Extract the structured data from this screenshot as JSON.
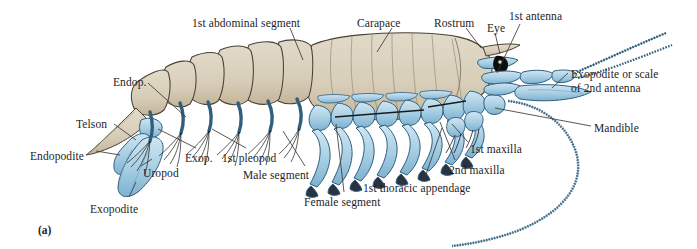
{
  "figure": {
    "caption": "(a)",
    "organism": "crayfish-lateral-anatomy",
    "background_color": "#ffffff"
  },
  "colors": {
    "carapace_tan": "#d9cfbb",
    "carapace_tan_shadow": "#c4b79d",
    "limb_blue": "#a8cfe4",
    "limb_blue_shadow": "#7fb4d2",
    "outline": "#2b2b2b",
    "seta_dark": "#1a1a1a",
    "label_text": "#1d1d1f",
    "leader_line": "#3a3a3a"
  },
  "labels": [
    {
      "id": "telson",
      "text": "Telson",
      "x": 76,
      "y": 118
    },
    {
      "id": "endop",
      "text": "Endop.",
      "x": 113,
      "y": 76
    },
    {
      "id": "endopodite",
      "text": "Endopodite",
      "x": 30,
      "y": 150
    },
    {
      "id": "uropod",
      "text": "Uropod",
      "x": 143,
      "y": 167
    },
    {
      "id": "exopodite",
      "text": "Exopodite",
      "x": 90,
      "y": 203
    },
    {
      "id": "exop",
      "text": "Exop.",
      "x": 185,
      "y": 152
    },
    {
      "id": "first-pleopod",
      "text": "1st pleopod",
      "x": 222,
      "y": 152
    },
    {
      "id": "male-segment",
      "text": "Male segment",
      "x": 243,
      "y": 169
    },
    {
      "id": "female-segment",
      "text": "Female segment",
      "x": 304,
      "y": 196
    },
    {
      "id": "first-abdominal",
      "text": "1st abdominal segment",
      "x": 192,
      "y": 17
    },
    {
      "id": "carapace",
      "text": "Carapace",
      "x": 357,
      "y": 17
    },
    {
      "id": "rostrum",
      "text": "Rostrum",
      "x": 434,
      "y": 17
    },
    {
      "id": "eye",
      "text": "Eye",
      "x": 487,
      "y": 22
    },
    {
      "id": "first-antenna",
      "text": "1st antenna",
      "x": 509,
      "y": 10
    },
    {
      "id": "exopodite-scale",
      "text": "Exopodite or scale\nof 2nd antenna",
      "x": 571,
      "y": 68
    },
    {
      "id": "mandible",
      "text": "Mandible",
      "x": 594,
      "y": 122
    },
    {
      "id": "first-maxilla",
      "text": "1st maxilla",
      "x": 470,
      "y": 143
    },
    {
      "id": "second-maxilla",
      "text": "2nd maxilla",
      "x": 449,
      "y": 164
    },
    {
      "id": "first-thoracic",
      "text": "1st thoracic appendage",
      "x": 363,
      "y": 182
    }
  ],
  "structures": {
    "abdominal_segments": 6,
    "pleopod_pairs": 5,
    "thoracic_appendage_pairs": 8,
    "antennal_flagella": 3
  }
}
